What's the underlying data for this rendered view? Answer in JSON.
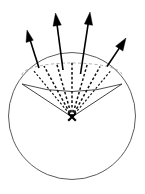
{
  "figure": {
    "background_color": "#ffffff",
    "width": 145,
    "height": 194
  },
  "colors": {
    "sphere_stroke": "#4a4a4a",
    "cap_back_rim_stroke": "#9a9a9a",
    "cap_front_rim_stroke": "#3a3a3a",
    "cone_edge_stroke": "#2b2b2b",
    "inner_ray_stroke": "#111111",
    "arrow_stroke": "#000000",
    "arrow_head_fill": "#000000",
    "apex_mark_stroke": "#000000"
  },
  "sphere": {
    "label": "sphere-outline",
    "center_x": 72,
    "center_y": 116,
    "radius": 63.5,
    "stroke_width": 0.9,
    "style": "solid"
  },
  "apex": {
    "label": "apex-point-marker",
    "glyph": "x",
    "x": 72,
    "y": 117,
    "arm_half_length": 4.2
  },
  "cap": {
    "back_rim": {
      "label": "cap-back-rim-dashed-ellipse",
      "center_x": 72,
      "center_y": 75,
      "rx": 50,
      "ry": 12,
      "style": "dashed",
      "dash_pattern": "3 2.4",
      "sweep": "back-half"
    },
    "front_rim": {
      "label": "cap-front-rim-solid-arc",
      "left_x": 22,
      "left_y": 84,
      "right_x": 122,
      "right_y": 84,
      "bulge_y": 93,
      "style": "solid"
    }
  },
  "cone_edges": [
    {
      "label": "cone-edge-left",
      "x1": 72,
      "y1": 117,
      "x2": 22,
      "y2": 84
    },
    {
      "label": "cone-edge-right",
      "x1": 72,
      "y1": 117,
      "x2": 122,
      "y2": 84
    }
  ],
  "inner_rays": [
    {
      "label": "inner-ray-1",
      "x1": 72,
      "y1": 117,
      "x2": 33.5,
      "y2": 70.5,
      "weight": "thin"
    },
    {
      "label": "inner-ray-2",
      "x1": 72,
      "y1": 117,
      "x2": 44.0,
      "y2": 66.0,
      "weight": "thick"
    },
    {
      "label": "inner-ray-3",
      "x1": 72,
      "y1": 117,
      "x2": 56.5,
      "y2": 63.0,
      "weight": "thick"
    },
    {
      "label": "inner-ray-4",
      "x1": 72,
      "y1": 117,
      "x2": 72.0,
      "y2": 62.0,
      "weight": "thick"
    },
    {
      "label": "inner-ray-5",
      "x1": 72,
      "y1": 117,
      "x2": 87.5,
      "y2": 63.5,
      "weight": "thick"
    },
    {
      "label": "inner-ray-6",
      "x1": 72,
      "y1": 117,
      "x2": 100.0,
      "y2": 66.5,
      "weight": "thick"
    },
    {
      "label": "inner-ray-7",
      "x1": 72,
      "y1": 117,
      "x2": 110.5,
      "y2": 71.0,
      "weight": "thin"
    }
  ],
  "outgoing_arrows": [
    {
      "label": "outgoing-arrow-left",
      "tail_x": 39.0,
      "tail_y": 68.0,
      "tip_x": 27.0,
      "tip_y": 30.0,
      "head_width": 7.0,
      "head_length": 11.0
    },
    {
      "label": "outgoing-arrow-center-left",
      "tail_x": 63.0,
      "tail_y": 70.0,
      "tip_x": 55.5,
      "tip_y": 13.0,
      "head_width": 7.0,
      "head_length": 11.5
    },
    {
      "label": "outgoing-arrow-center-right",
      "tail_x": 80.5,
      "tail_y": 74.0,
      "tip_x": 90.0,
      "tip_y": 12.0,
      "head_width": 7.0,
      "head_length": 11.5
    },
    {
      "label": "outgoing-arrow-right",
      "tail_x": 107.0,
      "tail_y": 66.5,
      "tip_x": 126.0,
      "tip_y": 38.0,
      "head_width": 7.0,
      "head_length": 11.0
    }
  ],
  "counts": {
    "outgoing_arrows": 4,
    "inner_rays": 7,
    "cone_edges": 2
  }
}
